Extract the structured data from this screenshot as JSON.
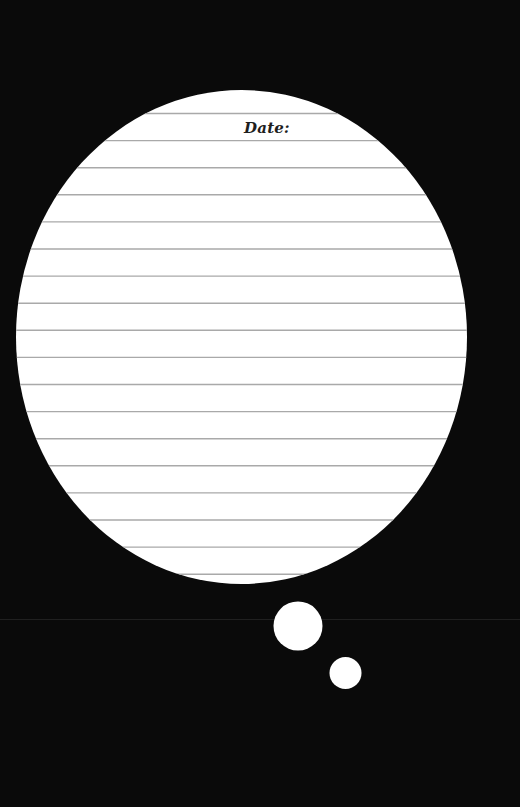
{
  "sheet": {
    "date_label": "Date:",
    "line_count": 18
  },
  "colors": {
    "background": "#0a0a0a",
    "bubble_fill": "#ffffff",
    "rule_line": "#a9a9a9",
    "text": "#1e1e1e"
  },
  "icons": {
    "thought_bubble_large": "thought-bubble-dot-large",
    "thought_bubble_small": "thought-bubble-dot-small"
  }
}
